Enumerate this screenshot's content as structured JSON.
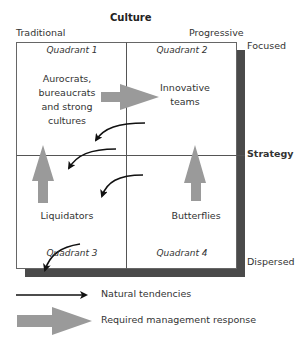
{
  "title": "Culture",
  "axes": {
    "x_left": "Traditional",
    "x_right": "Progressive",
    "y_label": "Strategy",
    "y_top": "Focused",
    "y_bottom": "Dispersed"
  },
  "quadrants": [
    {
      "id": 1,
      "label": "Quadrant 1",
      "content": [
        "Aurocrats,",
        "bureaucrats",
        "and strong",
        "cultures"
      ]
    },
    {
      "id": 2,
      "label": "Quadrant 2",
      "content": [
        "Innovative",
        "teams"
      ]
    },
    {
      "id": 3,
      "label": "Quadrant 3",
      "content": [
        "Liquidators"
      ]
    },
    {
      "id": 4,
      "label": "Quadrant 4",
      "content": [
        "Butterflies"
      ]
    }
  ],
  "legend": [
    {
      "icon": "thin-black-arrow-icon",
      "label": "Natural tendencies"
    },
    {
      "icon": "thick-gray-arrow-icon",
      "label": "Required management response"
    }
  ],
  "colors": {
    "box_border": "#555555",
    "shadow": "#4a4a4a",
    "gray_arrow": "#9a9a9a",
    "black_arrow": "#111111"
  }
}
